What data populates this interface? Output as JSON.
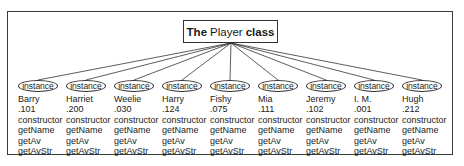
{
  "title": {
    "prefix": "The",
    "class_name": "Player",
    "suffix": "class"
  },
  "oval_label": "instance",
  "instances": [
    {
      "name": "Barry",
      "average": ".101",
      "methods": [
        "constructor",
        "getName",
        "getAv",
        "getAvStr"
      ]
    },
    {
      "name": "Harriet",
      "average": ".200",
      "methods": [
        "constructor",
        "getName",
        "getAv",
        "getAvStr"
      ]
    },
    {
      "name": "Weelie",
      "average": ".030",
      "methods": [
        "constructor",
        "getName",
        "getAv",
        "getAvStr"
      ]
    },
    {
      "name": "Harry",
      "average": ".124",
      "methods": [
        "constructor",
        "getName",
        "getAv",
        "getAvStr"
      ]
    },
    {
      "name": "Fishy",
      "average": ".075",
      "methods": [
        "constructor",
        "getName",
        "getAv",
        "getAvStr"
      ]
    },
    {
      "name": "Mia",
      "average": ".111",
      "methods": [
        "constructor",
        "getName",
        "getAv",
        "getAvStr"
      ]
    },
    {
      "name": "Jeremy",
      "average": ".102",
      "methods": [
        "constructor",
        "getName",
        "getAv",
        "getAvStr"
      ]
    },
    {
      "name": "I. M.",
      "average": ".001",
      "methods": [
        "constructor",
        "getName",
        "getAv",
        "getAvStr"
      ]
    },
    {
      "name": "Hugh",
      "average": ".212",
      "methods": [
        "constructor",
        "getName",
        "getAv",
        "getAvStr"
      ]
    }
  ]
}
